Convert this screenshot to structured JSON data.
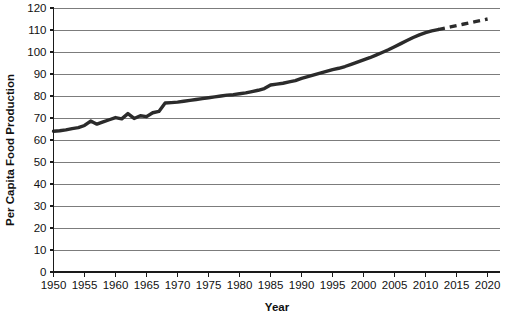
{
  "chart_data": {
    "type": "line",
    "title": "",
    "xlabel": "Year",
    "ylabel": "Per Capita Food Production",
    "xlim": [
      1950,
      2022
    ],
    "ylim": [
      0,
      120
    ],
    "grid": true,
    "legend_position": "none",
    "y_ticks": [
      0,
      10,
      20,
      30,
      40,
      50,
      60,
      70,
      80,
      90,
      100,
      110,
      120
    ],
    "x_ticks": [
      1950,
      1955,
      1960,
      1965,
      1970,
      1975,
      1980,
      1985,
      1990,
      1995,
      2000,
      2005,
      2010,
      2015,
      2020
    ],
    "series": [
      {
        "name": "Per Capita Food Production (observed)",
        "style": "solid",
        "color": "#2b2b2b",
        "x": [
          1950,
          1951,
          1952,
          1953,
          1954,
          1955,
          1956,
          1957,
          1958,
          1959,
          1960,
          1961,
          1962,
          1963,
          1964,
          1965,
          1966,
          1967,
          1968,
          1969,
          1970,
          1971,
          1972,
          1973,
          1974,
          1975,
          1976,
          1977,
          1978,
          1979,
          1980,
          1981,
          1982,
          1983,
          1984,
          1985,
          1986,
          1987,
          1988,
          1989,
          1990,
          1991,
          1992,
          1993,
          1994,
          1995,
          1996,
          1997,
          1998,
          1999,
          2000,
          2001,
          2002,
          2003,
          2004,
          2005,
          2006,
          2007,
          2008,
          2009,
          2010,
          2011,
          2012
        ],
        "values": [
          64.0,
          64.2,
          64.6,
          65.2,
          65.6,
          66.6,
          68.6,
          67.2,
          68.2,
          69.2,
          70.2,
          69.6,
          72.0,
          69.8,
          71.0,
          70.6,
          72.4,
          73.0,
          76.8,
          77.0,
          77.2,
          77.6,
          78.0,
          78.4,
          78.8,
          79.2,
          79.6,
          80.0,
          80.4,
          80.6,
          81.0,
          81.4,
          82.0,
          82.6,
          83.4,
          85.0,
          85.4,
          85.8,
          86.4,
          87.0,
          88.0,
          88.8,
          89.6,
          90.4,
          91.2,
          92.0,
          92.6,
          93.4,
          94.4,
          95.4,
          96.4,
          97.4,
          98.6,
          99.8,
          101.0,
          102.4,
          103.8,
          105.2,
          106.6,
          107.8,
          108.8,
          109.6,
          110.2
        ]
      },
      {
        "name": "Per Capita Food Production (projected)",
        "style": "dashed",
        "color": "#2b2b2b",
        "x": [
          2012,
          2014,
          2016,
          2018,
          2020
        ],
        "values": [
          110.2,
          111.4,
          112.6,
          113.8,
          115.0
        ]
      }
    ]
  }
}
